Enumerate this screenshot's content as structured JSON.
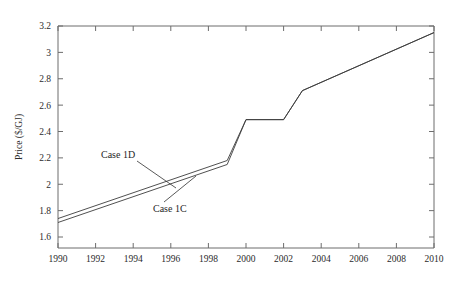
{
  "chart_data": {
    "type": "line",
    "title": "",
    "xlabel": "",
    "ylabel": "Price ($/GJ)",
    "xlim": [
      1990,
      2010
    ],
    "ylim": [
      1.55,
      3.25
    ],
    "xticks": [
      "1990",
      "1992",
      "1994",
      "1996",
      "1998",
      "2000",
      "2002",
      "2004",
      "2006",
      "2008",
      "2010"
    ],
    "yticks": [
      "1.6",
      "1.8",
      "2",
      "2.2",
      "2.4",
      "2.6",
      "2.8",
      "3",
      "3.2"
    ],
    "grid": false,
    "legend_position": "inline-annotations",
    "x": [
      1990,
      1999,
      2000,
      2002,
      2003,
      2010
    ],
    "series": [
      {
        "name": "Case 1D",
        "values": [
          1.74,
          2.18,
          2.49,
          2.49,
          2.71,
          3.15
        ]
      },
      {
        "name": "Case 1C",
        "values": [
          1.71,
          2.15,
          2.49,
          2.49,
          2.71,
          3.15
        ]
      }
    ],
    "annotations": [
      {
        "text": "Case 1D",
        "x": 1994.4,
        "y": 2.26
      },
      {
        "text": "Case 1C",
        "x": 1997.0,
        "y": 1.89
      }
    ],
    "colors": {
      "line": "#3c3c3c",
      "axis": "#6d6d6d",
      "text": "#2b2b2b",
      "background": "#ffffff"
    }
  },
  "page": {
    "title_text": ""
  }
}
